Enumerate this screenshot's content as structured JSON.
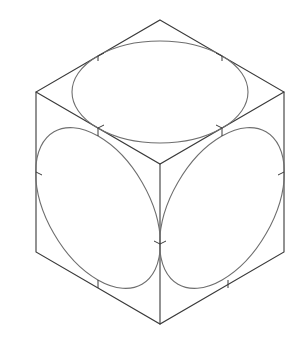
{
  "diagram": {
    "title": "",
    "colors": {
      "background": "#ffffff",
      "edge": "#3a3a3a",
      "ellipse": "#6e6e6e"
    },
    "cube": {
      "vertices": {
        "top": [
          160,
          20
        ],
        "upper_left": [
          36,
          92
        ],
        "upper_right": [
          284,
          92
        ],
        "center": [
          160,
          164
        ],
        "lower_left": [
          36,
          252
        ],
        "lower_right": [
          284,
          252
        ],
        "bottom": [
          160,
          324
        ]
      }
    },
    "faces": [
      {
        "name": "top",
        "ellipse": {
          "cx": 160,
          "cy": 92,
          "rx": 88,
          "ry": 51,
          "rotate": 0
        }
      },
      {
        "name": "left",
        "ellipse": {
          "cx": 98,
          "cy": 208,
          "rx": 88,
          "ry": 51,
          "rotate": 60
        }
      },
      {
        "name": "right",
        "ellipse": {
          "cx": 222,
          "cy": 208,
          "rx": 88,
          "ry": 51,
          "rotate": -60
        }
      }
    ],
    "tangent_ticks": [
      [
        98,
        56
      ],
      [
        222,
        56
      ],
      [
        98,
        128
      ],
      [
        222,
        128
      ],
      [
        36,
        172
      ],
      [
        284,
        172
      ],
      [
        160,
        244
      ],
      [
        98,
        288
      ],
      [
        222,
        288
      ]
    ]
  }
}
